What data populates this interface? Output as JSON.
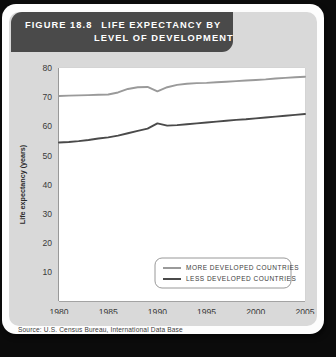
{
  "header": {
    "figure_number": "FIGURE 18.8",
    "title_line1": "LIFE EXPECTANCY BY",
    "title_line2": "LEVEL OF DEVELOPMENT"
  },
  "source": "Source: U.S. Census Bureau, International Data Base",
  "colors": {
    "header_bar": "#4a4a4a",
    "panel": "#d9d9d9",
    "card": "#fdfdfd",
    "plot_bg": "#ffffff",
    "grid": "#d2d2d2",
    "axis": "#6e6e6e",
    "more_developed": "#9a9a9a",
    "less_developed": "#4a4a4a"
  },
  "chart_data": {
    "type": "line",
    "title": "LIFE EXPECTANCY BY LEVEL OF DEVELOPMENT",
    "xlabel": "Year",
    "ylabel": "Life expectancy (years)",
    "xlim": [
      1980,
      2005
    ],
    "ylim": [
      0,
      80
    ],
    "xticks": [
      1980,
      1985,
      1990,
      1995,
      2000,
      2005
    ],
    "yticks": [
      10,
      20,
      30,
      40,
      50,
      60,
      70,
      80
    ],
    "grid": true,
    "legend_position": "lower right",
    "x": [
      1980,
      1981,
      1982,
      1983,
      1984,
      1985,
      1986,
      1987,
      1988,
      1989,
      1990,
      1991,
      1992,
      1993,
      1994,
      1995,
      1996,
      1997,
      1998,
      1999,
      2000,
      2001,
      2002,
      2003,
      2004,
      2005
    ],
    "series": [
      {
        "name": "MORE DEVELOPED COUNTRIES",
        "color": "#9a9a9a",
        "values": [
          70.4,
          70.5,
          70.6,
          70.7,
          70.8,
          70.9,
          71.6,
          72.8,
          73.4,
          73.5,
          72.0,
          73.4,
          74.2,
          74.6,
          74.8,
          74.9,
          75.1,
          75.3,
          75.5,
          75.7,
          75.9,
          76.1,
          76.4,
          76.6,
          76.8,
          77.0
        ]
      },
      {
        "name": "LESS DEVELOPED COUNTRIES",
        "color": "#4a4a4a",
        "values": [
          54.4,
          54.6,
          54.9,
          55.3,
          55.8,
          56.2,
          56.8,
          57.6,
          58.4,
          59.2,
          61.0,
          60.2,
          60.4,
          60.7,
          61.0,
          61.3,
          61.6,
          61.9,
          62.2,
          62.4,
          62.7,
          63.0,
          63.3,
          63.6,
          63.9,
          64.2
        ]
      }
    ],
    "legend": [
      {
        "label": "MORE DEVELOPED COUNTRIES",
        "color": "#9a9a9a"
      },
      {
        "label": "LESS DEVELOPED COUNTRIES",
        "color": "#4a4a4a"
      }
    ]
  }
}
